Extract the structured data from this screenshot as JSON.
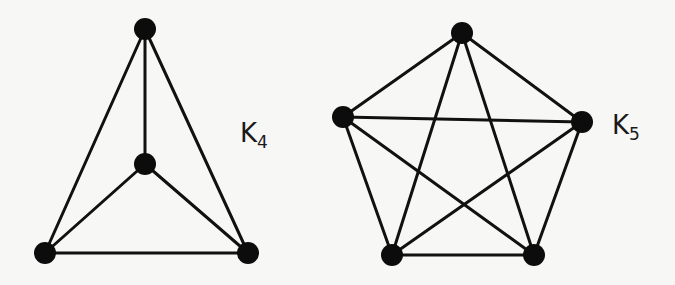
{
  "graphs": [
    {
      "id": "k4",
      "label": "K",
      "subscript": "4",
      "label_pos": [
        240,
        120
      ],
      "nodes": [
        [
          145,
          29
        ],
        [
          145,
          164
        ],
        [
          45,
          253
        ],
        [
          248,
          253
        ]
      ],
      "edges": [
        [
          0,
          1
        ],
        [
          0,
          2
        ],
        [
          0,
          3
        ],
        [
          1,
          2
        ],
        [
          1,
          3
        ],
        [
          2,
          3
        ]
      ]
    },
    {
      "id": "k5",
      "label": "K",
      "subscript": "5",
      "label_pos": [
        612,
        112
      ],
      "nodes": [
        [
          462,
          33
        ],
        [
          343,
          117
        ],
        [
          582,
          122
        ],
        [
          392,
          255
        ],
        [
          534,
          255
        ]
      ],
      "edges": [
        [
          0,
          1
        ],
        [
          0,
          2
        ],
        [
          0,
          3
        ],
        [
          0,
          4
        ],
        [
          1,
          2
        ],
        [
          1,
          3
        ],
        [
          1,
          4
        ],
        [
          2,
          3
        ],
        [
          2,
          4
        ],
        [
          3,
          4
        ]
      ]
    }
  ],
  "style": {
    "edge_color": "#111111",
    "node_color": "#0c0c0c",
    "node_radius": 11,
    "background": "#f7f7f5"
  }
}
